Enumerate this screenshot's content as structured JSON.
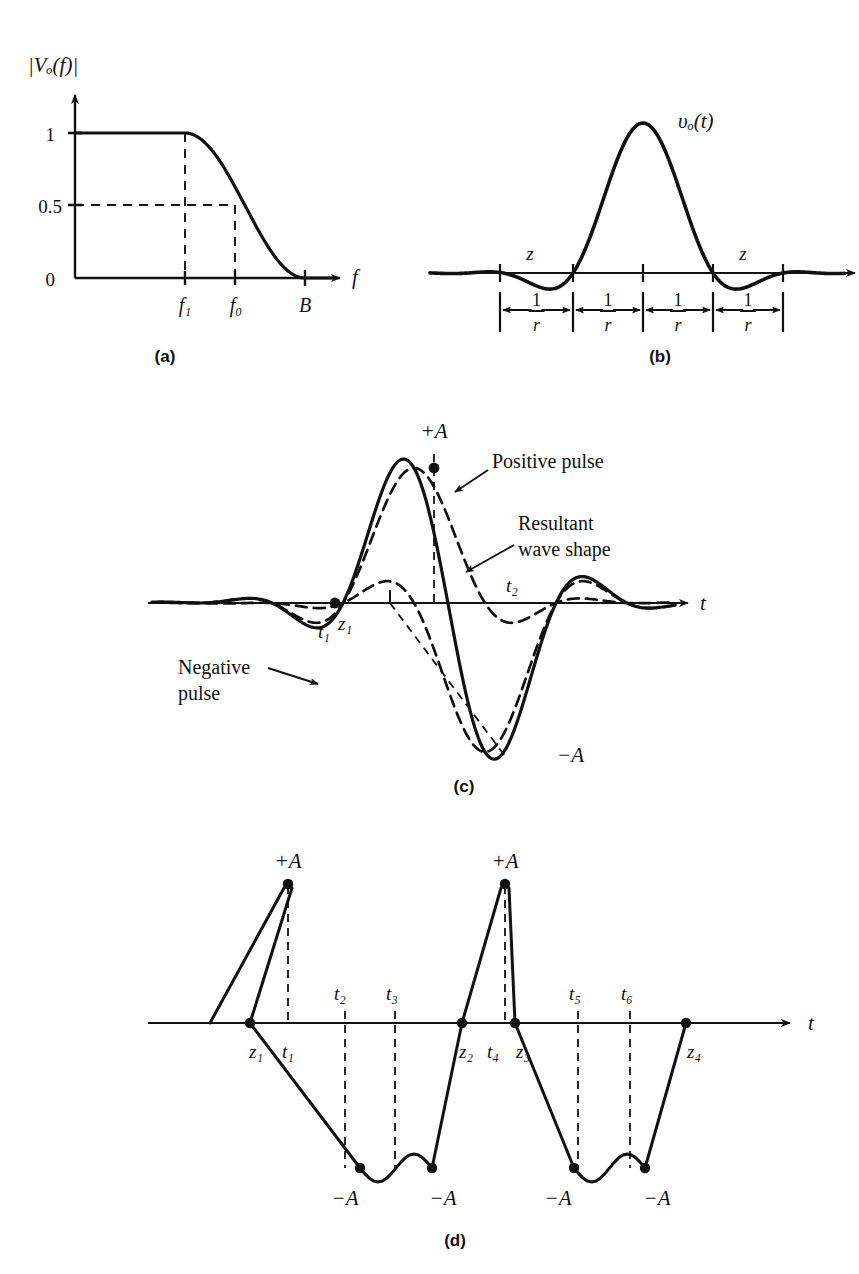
{
  "figure": {
    "title_hidden": "Raised-cosine pulse shaping and intersymbol interference",
    "stroke_color": "#111111",
    "background": "#ffffff"
  },
  "panels": [
    {
      "id": "a",
      "caption": "(a)",
      "caption_pos": {
        "x": 165,
        "y": 360
      },
      "yaxis_label": "|Vₒ(f)|",
      "yaxis_label_pos": {
        "x": 28,
        "y": 72
      },
      "xaxis_label": "f",
      "xaxis_label_pos": {
        "x": 352,
        "y": 282
      },
      "y_ticks": [
        {
          "label": "1",
          "x": 55,
          "y": 139
        },
        {
          "label": "0.5",
          "x": 40,
          "y": 211
        },
        {
          "label": "0",
          "x": 55,
          "y": 284
        }
      ],
      "x_ticks": [
        {
          "label": "f₁",
          "x": 185,
          "y": 310
        },
        {
          "label": "f₀",
          "x": 236,
          "y": 310
        },
        {
          "label": "B",
          "x": 305,
          "y": 310
        }
      ],
      "geometry": {
        "origin": {
          "x": 75,
          "y": 278
        },
        "y_top": 95,
        "x_end": 340,
        "level_one_y": 133,
        "level_half_y": 205,
        "f1_x": 185,
        "f0_x": 235,
        "B_x": 305
      }
    },
    {
      "id": "b",
      "caption": "(b)",
      "caption_pos": {
        "x": 660,
        "y": 360
      },
      "signal_label": "υₒ(t)",
      "signal_label_pos": {
        "x": 678,
        "y": 122
      },
      "zero_labels": [
        {
          "label": "z",
          "x": 530,
          "y": 258
        },
        {
          "label": "z",
          "x": 743,
          "y": 258
        }
      ],
      "interval_label_numerator": "1",
      "interval_label_denominator": "r",
      "interval_count": 4,
      "geometry": {
        "baseline_y": 273,
        "x_start": 430,
        "x_end": 855,
        "peak_x": 643,
        "peak_y": 123,
        "symbol_period_px": 70,
        "dim_line_y": 310,
        "ticks_x": [
          500,
          573,
          643,
          713,
          783
        ]
      }
    },
    {
      "id": "c",
      "caption": "(c)",
      "caption_pos": {
        "x": 464,
        "y": 790
      },
      "xaxis_label": "t",
      "xaxis_label_pos": {
        "x": 700,
        "y": 604
      },
      "amplitude_labels": [
        {
          "label": "+A",
          "x": 434,
          "y": 432
        },
        {
          "label": "−A",
          "x": 557,
          "y": 757
        }
      ],
      "time_labels": [
        {
          "label": "t₁",
          "x": 324,
          "y": 632
        },
        {
          "label": "t₂",
          "x": 512,
          "y": 588
        }
      ],
      "zero_labels": [
        {
          "label": "z₁",
          "x": 337,
          "y": 626
        }
      ],
      "annotations": [
        {
          "text": "Positive pulse",
          "x": 492,
          "y": 462,
          "lines": [
            "Positive pulse"
          ],
          "arrow_from": {
            "x": 488,
            "y": 470
          },
          "arrow_to": {
            "x": 455,
            "y": 492
          }
        },
        {
          "text": "Resultant wave shape",
          "x": 518,
          "y": 528,
          "lines": [
            "Resultant",
            "wave shape"
          ],
          "arrow_from": {
            "x": 514,
            "y": 545
          },
          "arrow_to": {
            "x": 466,
            "y": 572
          }
        },
        {
          "text": "Negative pulse",
          "x": 178,
          "y": 668,
          "lines": [
            "Negative",
            "pulse"
          ],
          "arrow_from": {
            "x": 268,
            "y": 668
          },
          "arrow_to": {
            "x": 318,
            "y": 682
          }
        }
      ],
      "geometry": {
        "baseline_y": 603,
        "x_start": 148,
        "x_end": 688,
        "peak_x": 434,
        "peak_y": 468,
        "trough_x": 505,
        "trough_y": 752,
        "z1_x": 335,
        "symbol_period_px": 71,
        "pos_pulse_center": 414,
        "neg_pulse_center": 485
      }
    },
    {
      "id": "d",
      "caption": "(d)",
      "caption_pos": {
        "x": 455,
        "y": 1243
      },
      "xaxis_label": "t",
      "xaxis_label_pos": {
        "x": 808,
        "y": 1024
      },
      "amplitude_labels": [
        {
          "label": "+A",
          "x": 288,
          "y": 862
        },
        {
          "label": "+A",
          "x": 505,
          "y": 862
        },
        {
          "label": "−A",
          "x": 345,
          "y": 1199
        },
        {
          "label": "−A",
          "x": 440,
          "y": 1199
        },
        {
          "label": "−A",
          "x": 558,
          "y": 1199
        },
        {
          "label": "−A",
          "x": 655,
          "y": 1199
        }
      ],
      "time_labels": [
        {
          "label": "t₁",
          "x": 288,
          "y": 1052
        },
        {
          "label": "t₂",
          "x": 340,
          "y": 995
        },
        {
          "label": "t₃",
          "x": 390,
          "y": 995
        },
        {
          "label": "t₄",
          "x": 505,
          "y": 1052
        },
        {
          "label": "t₅",
          "x": 573,
          "y": 995
        },
        {
          "label": "t₆",
          "x": 625,
          "y": 995
        }
      ],
      "zero_labels": [
        {
          "label": "z₁",
          "x": 256,
          "y": 1052
        },
        {
          "label": "z₂",
          "x": 466,
          "y": 1052
        },
        {
          "label": "z₃",
          "x": 520,
          "y": 1052
        },
        {
          "label": "z₄",
          "x": 692,
          "y": 1052
        }
      ],
      "geometry": {
        "baseline_y": 1023,
        "x_start": 148,
        "x_end": 790,
        "peak_y": 884,
        "trough_y": 1168,
        "peaks_x": [
          288,
          505
        ],
        "troughs_x": [
          360,
          432,
          574,
          645
        ],
        "zeros_x": [
          250,
          462,
          515,
          686
        ],
        "dashed_x": [
          288,
          345,
          395,
          505,
          578,
          630
        ]
      }
    }
  ],
  "chart_data": {
    "type": "line",
    "subcharts": [
      {
        "id": "a",
        "type": "line",
        "title": "Raised-cosine amplitude response",
        "xlabel": "f",
        "ylabel": "|Vₒ(f)|",
        "ylim": [
          0,
          1
        ],
        "ytick_values": [
          0,
          0.5,
          1
        ],
        "ytick_labels": [
          "0",
          "0.5",
          "1"
        ],
        "xtick_labels": [
          "f₁",
          "f₀",
          "B"
        ],
        "xtick_values": [
          0.5,
          0.7,
          1.0
        ],
        "grid": false,
        "legend": "none",
        "description": "Flat at 1 until f1, raised-cosine rolloff through 0.5 at f0, reaching 0 at B",
        "x": [
          0.0,
          0.1,
          0.2,
          0.3,
          0.4,
          0.5,
          0.55,
          0.6,
          0.65,
          0.7,
          0.75,
          0.8,
          0.85,
          0.9,
          0.95,
          1.0
        ],
        "y": [
          1.0,
          1.0,
          1.0,
          1.0,
          1.0,
          1.0,
          0.95,
          0.83,
          0.66,
          0.5,
          0.34,
          0.18,
          0.08,
          0.02,
          0.004,
          0.0
        ]
      },
      {
        "id": "b",
        "type": "line",
        "title": "Raised-cosine impulse response υₒ(t)",
        "xlabel": "t",
        "ylabel": "υₒ(t)",
        "grid": false,
        "legend": "none",
        "annotations": [
          "z",
          "z",
          "1/r",
          "1/r",
          "1/r",
          "1/r"
        ],
        "description": "Single raised-cosine pulse peaking at 1 with zero crossings spaced by symbol interval 1/r and small decaying side lobes",
        "x": [
          -3.0,
          -2.5,
          -2.0,
          -1.5,
          -1.0,
          -0.75,
          -0.5,
          -0.25,
          0.0,
          0.25,
          0.5,
          0.75,
          1.0,
          1.5,
          2.0,
          2.5,
          3.0
        ],
        "y": [
          0.0,
          -0.07,
          0.0,
          0.09,
          0.0,
          0.3,
          0.7,
          0.93,
          1.0,
          0.93,
          0.7,
          0.3,
          0.0,
          0.09,
          0.0,
          -0.07,
          0.0
        ]
      },
      {
        "id": "c",
        "type": "line",
        "title": "Positive and negative pulses with resultant wave shape",
        "xlabel": "t",
        "grid": false,
        "legend": "inline-annotations",
        "series": [
          {
            "name": "Positive pulse",
            "style": "dashed",
            "x": [
              -3,
              -2,
              -1,
              -0.5,
              0,
              0.5,
              1,
              2,
              3
            ],
            "y": [
              0.0,
              0.0,
              0.0,
              0.7,
              1.0,
              0.7,
              0.0,
              0.0,
              0.0
            ]
          },
          {
            "name": "Negative pulse",
            "style": "dashed",
            "x": [
              -2,
              -1,
              0,
              0.5,
              1,
              1.5,
              2,
              3,
              4
            ],
            "y": [
              0.0,
              0.0,
              0.0,
              -0.7,
              -1.0,
              -0.7,
              0.0,
              0.0,
              0.0
            ]
          },
          {
            "name": "Resultant wave shape",
            "style": "solid",
            "x": [
              -2,
              -1,
              -0.5,
              0,
              0.5,
              1,
              1.5,
              2,
              3
            ],
            "y": [
              0.0,
              0.0,
              0.7,
              1.0,
              0.0,
              -1.0,
              -0.7,
              0.0,
              0.0
            ]
          }
        ],
        "markers": [
          {
            "label": "+A",
            "value": 1.0
          },
          {
            "label": "−A",
            "value": -1.0
          },
          {
            "label": "z₁",
            "value": 0.0
          },
          {
            "label": "t₁",
            "value": 0.0
          },
          {
            "label": "t₂",
            "value": 0.0
          }
        ]
      },
      {
        "id": "d",
        "type": "line",
        "title": "Resultant data waveform with sampling instants",
        "xlabel": "t",
        "grid": false,
        "legend": "none",
        "description": "Binary waveform alternating +A peaks and -A levels, with zero crossings z1..z4 and sampling times t1..t6",
        "sample_labels": [
          "t₁",
          "t₂",
          "t₃",
          "t₄",
          "t₅",
          "t₆"
        ],
        "zero_labels": [
          "z₁",
          "z₂",
          "z₃",
          "z₄"
        ],
        "amplitude_labels": [
          "+A",
          "+A",
          "−A",
          "−A",
          "−A",
          "−A"
        ],
        "values": [
          1.0,
          -1.0,
          -1.0,
          1.0,
          -1.0,
          -1.0
        ]
      }
    ]
  }
}
